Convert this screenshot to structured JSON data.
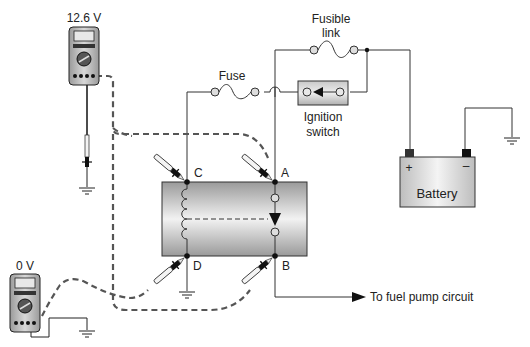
{
  "diagram": {
    "meters": {
      "top": {
        "reading": "12.6 V"
      },
      "bottom": {
        "reading": "0 V"
      }
    },
    "components": {
      "fusible_link": {
        "label_line1": "Fusible",
        "label_line2": "link"
      },
      "fuse": {
        "label": "Fuse"
      },
      "ignition_switch": {
        "label_line1": "Ignition",
        "label_line2": "switch"
      },
      "battery": {
        "label": "Battery",
        "positive": "+",
        "negative": "–"
      },
      "relay": {
        "terminal_a": "A",
        "terminal_b": "B",
        "terminal_c": "C",
        "terminal_d": "D"
      }
    },
    "output": {
      "label": "To fuel pump circuit"
    }
  }
}
